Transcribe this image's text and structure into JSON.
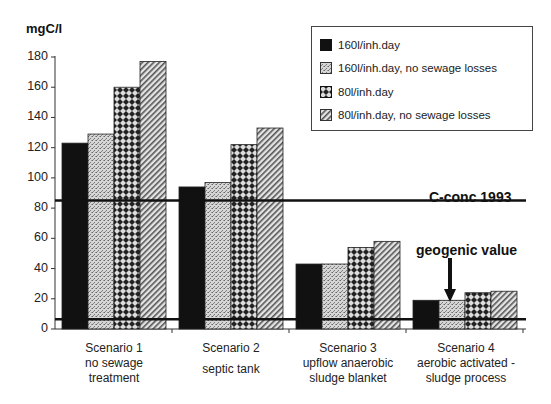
{
  "chart_data": {
    "type": "bar",
    "title": "",
    "ylabel": "mgC/l",
    "xlabel": "",
    "ylim": [
      0,
      180
    ],
    "yticks": [
      0,
      20,
      40,
      60,
      80,
      100,
      120,
      140,
      160,
      180
    ],
    "grid": false,
    "legend_position": "top-right",
    "categories": [
      [
        "Scenario 1",
        "no sewage",
        "treatment"
      ],
      [
        "Scenario 2",
        "septic  tank"
      ],
      [
        "Scenario 3",
        "upflow anaerobic",
        "sludge blanket"
      ],
      [
        "Scenario 4",
        "aerobic activated -",
        "sludge process"
      ]
    ],
    "series": [
      {
        "name": "160l/inh.day",
        "pattern": "solid-black",
        "values": [
          123,
          94,
          43,
          19
        ]
      },
      {
        "name": "160l/inh.day, no sewage losses",
        "pattern": "stipple",
        "values": [
          129,
          97,
          43,
          19
        ]
      },
      {
        "name": "80l/inh.day",
        "pattern": "crosshatch",
        "values": [
          160,
          122,
          54,
          24
        ]
      },
      {
        "name": "80l/inh.day, no sewage losses",
        "pattern": "diagonal",
        "values": [
          177,
          133,
          58,
          25
        ]
      }
    ],
    "reference_lines": [
      {
        "label": "C-conc 1993",
        "value": 85
      },
      {
        "label": "geogenic value",
        "value": 6.5
      }
    ],
    "annotations": [
      {
        "text": "C-conc 1993",
        "near": "upper reference line, right"
      },
      {
        "text": "geogenic value",
        "arrow_to": "Scenario 4 bars / lower reference line"
      }
    ]
  }
}
